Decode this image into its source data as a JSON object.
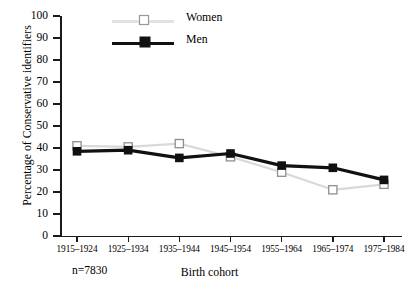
{
  "chart_data": {
    "type": "line",
    "title": "",
    "xlabel": "Birth cohort",
    "ylabel": "Percentage of Conservative identifiers",
    "categories": [
      "1915–1924",
      "1925–1934",
      "1935–1944",
      "1945–1954",
      "1955–1964",
      "1965–1974",
      "1975–1984"
    ],
    "series": [
      {
        "name": "Women",
        "values": [
          41,
          40.5,
          42,
          36,
          29,
          21,
          23.5
        ],
        "color": "#d9d9d9",
        "marker": "open-square"
      },
      {
        "name": "Men",
        "values": [
          38.5,
          39,
          35.5,
          37.5,
          32,
          31,
          25.5
        ],
        "color": "#111111",
        "marker": "filled-square"
      }
    ],
    "ylim": [
      0,
      100
    ],
    "yticks": [
      0,
      10,
      20,
      30,
      40,
      50,
      60,
      70,
      80,
      90,
      100
    ],
    "ytick_labels": [
      "0",
      "10",
      "20",
      "30",
      "40",
      "50",
      "60",
      "70",
      "80",
      "90",
      "100"
    ],
    "grid": false,
    "legend_position": "top-left",
    "annotation": "n=7830"
  },
  "axes": {
    "y_axis_title": "Percentage of Conservative identifiers",
    "x_axis_title": "Birth cohort",
    "sample_size_note": "n=7830"
  },
  "legend": {
    "entries": [
      {
        "label": "Women"
      },
      {
        "label": "Men"
      }
    ]
  }
}
